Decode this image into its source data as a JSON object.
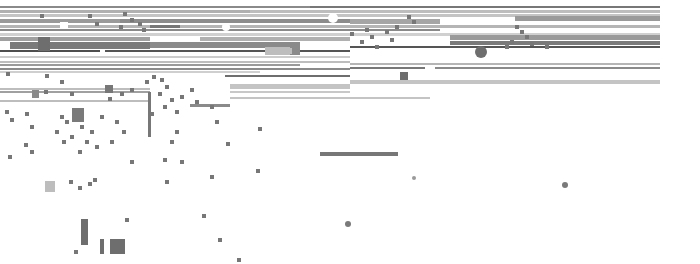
{
  "canvas": {
    "width": 700,
    "height": 264,
    "background": "#ffffff"
  },
  "palette": {
    "dark": "#555555",
    "mid": "#7a7a7a",
    "light": "#a8a8a8",
    "pale": "#c8c8c8",
    "white": "#ffffff"
  },
  "bars": [
    {
      "x": 0,
      "y": 6,
      "w": 310,
      "h": 2,
      "c": "#8a8a8a"
    },
    {
      "x": 310,
      "y": 6,
      "w": 350,
      "h": 2,
      "c": "#777777"
    },
    {
      "x": 0,
      "y": 10,
      "w": 250,
      "h": 3,
      "c": "#b0b0b0"
    },
    {
      "x": 250,
      "y": 10,
      "w": 410,
      "h": 3,
      "c": "#bdbdbd"
    },
    {
      "x": 0,
      "y": 14,
      "w": 660,
      "h": 3,
      "c": "#c4c4c4"
    },
    {
      "x": 0,
      "y": 19,
      "w": 120,
      "h": 4,
      "c": "#9a9a9a"
    },
    {
      "x": 120,
      "y": 19,
      "w": 230,
      "h": 4,
      "c": "#8c8c8c"
    },
    {
      "x": 350,
      "y": 19,
      "w": 90,
      "h": 5,
      "c": "#a5a5a5"
    },
    {
      "x": 515,
      "y": 16,
      "w": 145,
      "h": 5,
      "c": "#9a9a9a"
    },
    {
      "x": 0,
      "y": 25,
      "w": 660,
      "h": 3,
      "c": "#b5b5b5"
    },
    {
      "x": 0,
      "y": 29,
      "w": 440,
      "h": 2,
      "c": "#8a8a8a"
    },
    {
      "x": 150,
      "y": 25,
      "w": 30,
      "h": 3,
      "c": "#777777"
    },
    {
      "x": 0,
      "y": 33,
      "w": 660,
      "h": 3,
      "c": "#d0d0d0"
    },
    {
      "x": 0,
      "y": 37,
      "w": 150,
      "h": 4,
      "c": "#a0a0a0"
    },
    {
      "x": 200,
      "y": 37,
      "w": 150,
      "h": 4,
      "c": "#b0b0b0"
    },
    {
      "x": 450,
      "y": 35,
      "w": 210,
      "h": 5,
      "c": "#9a9a9a"
    },
    {
      "x": 10,
      "y": 42,
      "w": 140,
      "h": 7,
      "c": "#7a7a7a"
    },
    {
      "x": 150,
      "y": 42,
      "w": 150,
      "h": 6,
      "c": "#8a8a8a"
    },
    {
      "x": 450,
      "y": 41,
      "w": 210,
      "h": 4,
      "c": "#7a7a7a"
    },
    {
      "x": 0,
      "y": 50,
      "w": 100,
      "h": 2,
      "c": "#4e4e4e"
    },
    {
      "x": 105,
      "y": 50,
      "w": 160,
      "h": 2,
      "c": "#555555"
    },
    {
      "x": 265,
      "y": 47,
      "w": 30,
      "h": 8,
      "c": "#bdbdbd"
    },
    {
      "x": 290,
      "y": 47,
      "w": 10,
      "h": 8,
      "c": "#8a8a8a"
    },
    {
      "x": 300,
      "y": 50,
      "w": 50,
      "h": 2,
      "c": "#555555"
    },
    {
      "x": 350,
      "y": 46,
      "w": 310,
      "h": 2,
      "c": "#555555"
    },
    {
      "x": 0,
      "y": 56,
      "w": 350,
      "h": 2,
      "c": "#cccccc"
    },
    {
      "x": 0,
      "y": 61,
      "w": 350,
      "h": 2,
      "c": "#bdbdbd"
    },
    {
      "x": 0,
      "y": 64,
      "w": 300,
      "h": 2,
      "c": "#9a9a9a"
    },
    {
      "x": 350,
      "y": 63,
      "w": 310,
      "h": 2,
      "c": "#b5b5b5"
    },
    {
      "x": 0,
      "y": 68,
      "w": 350,
      "h": 2,
      "c": "#8a8a8a"
    },
    {
      "x": 350,
      "y": 67,
      "w": 75,
      "h": 2,
      "c": "#777777"
    },
    {
      "x": 435,
      "y": 67,
      "w": 225,
      "h": 2,
      "c": "#8a8a8a"
    },
    {
      "x": 0,
      "y": 71,
      "w": 260,
      "h": 2,
      "c": "#cfcfcf"
    },
    {
      "x": 225,
      "y": 75,
      "w": 125,
      "h": 2,
      "c": "#6e6e6e"
    },
    {
      "x": 350,
      "y": 80,
      "w": 310,
      "h": 4,
      "c": "#c4c4c4"
    },
    {
      "x": 0,
      "y": 88,
      "w": 150,
      "h": 2,
      "c": "#bdbdbd"
    },
    {
      "x": 230,
      "y": 84,
      "w": 120,
      "h": 5,
      "c": "#c4c4c4"
    },
    {
      "x": 0,
      "y": 91,
      "w": 150,
      "h": 2,
      "c": "#a0a0a0"
    },
    {
      "x": 230,
      "y": 91,
      "w": 120,
      "h": 2,
      "c": "#c8c8c8"
    },
    {
      "x": 0,
      "y": 100,
      "w": 150,
      "h": 2,
      "c": "#bdbdbd"
    },
    {
      "x": 230,
      "y": 97,
      "w": 200,
      "h": 2,
      "c": "#c4c4c4"
    },
    {
      "x": 190,
      "y": 104,
      "w": 40,
      "h": 3,
      "c": "#8a8a8a"
    },
    {
      "x": 320,
      "y": 152,
      "w": 78,
      "h": 4,
      "c": "#777777"
    }
  ],
  "blocks": [
    {
      "x": 38,
      "y": 37,
      "w": 12,
      "h": 14,
      "c": "#6e6e6e"
    },
    {
      "x": 60,
      "y": 22,
      "w": 8,
      "h": 6,
      "c": "#ffffff"
    },
    {
      "x": 2,
      "y": 42,
      "w": 8,
      "h": 8,
      "c": "#ffffff"
    },
    {
      "x": 270,
      "y": 48,
      "w": 22,
      "h": 6,
      "c": "#bdbdbd"
    },
    {
      "x": 400,
      "y": 72,
      "w": 8,
      "h": 8,
      "c": "#6e6e6e"
    },
    {
      "x": 105,
      "y": 85,
      "w": 8,
      "h": 8,
      "c": "#777777"
    },
    {
      "x": 32,
      "y": 90,
      "w": 7,
      "h": 8,
      "c": "#8a8a8a"
    },
    {
      "x": 72,
      "y": 108,
      "w": 12,
      "h": 14,
      "c": "#7a7a7a"
    },
    {
      "x": 45,
      "y": 181,
      "w": 10,
      "h": 11,
      "c": "#bdbdbd"
    },
    {
      "x": 81,
      "y": 219,
      "w": 7,
      "h": 26,
      "c": "#6e6e6e"
    },
    {
      "x": 100,
      "y": 239,
      "w": 4,
      "h": 15,
      "c": "#6e6e6e"
    },
    {
      "x": 110,
      "y": 239,
      "w": 15,
      "h": 15,
      "c": "#6e6e6e"
    },
    {
      "x": 148,
      "y": 92,
      "w": 3,
      "h": 45,
      "c": "#777777"
    }
  ],
  "dots": [
    {
      "x": 333,
      "y": 18,
      "r": 5,
      "c": "#ffffff"
    },
    {
      "x": 226,
      "y": 27,
      "r": 4,
      "c": "#ffffff"
    },
    {
      "x": 481,
      "y": 52,
      "r": 6,
      "c": "#6e6e6e"
    },
    {
      "x": 565,
      "y": 185,
      "r": 3,
      "c": "#7a7a7a"
    },
    {
      "x": 348,
      "y": 224,
      "r": 3,
      "c": "#7a7a7a"
    },
    {
      "x": 414,
      "y": 178,
      "r": 2,
      "c": "#9a9a9a"
    }
  ],
  "specks": [
    [
      40,
      14
    ],
    [
      88,
      14
    ],
    [
      123,
      12
    ],
    [
      130,
      18
    ],
    [
      138,
      22
    ],
    [
      119,
      25
    ],
    [
      142,
      28
    ],
    [
      95,
      22
    ],
    [
      407,
      15
    ],
    [
      412,
      20
    ],
    [
      395,
      25
    ],
    [
      385,
      30
    ],
    [
      370,
      35
    ],
    [
      360,
      40
    ],
    [
      365,
      28
    ],
    [
      350,
      32
    ],
    [
      375,
      45
    ],
    [
      390,
      38
    ],
    [
      515,
      25
    ],
    [
      520,
      30
    ],
    [
      525,
      35
    ],
    [
      510,
      40
    ],
    [
      530,
      42
    ],
    [
      505,
      45
    ],
    [
      545,
      45
    ],
    [
      6,
      72
    ],
    [
      45,
      74
    ],
    [
      60,
      80
    ],
    [
      44,
      90
    ],
    [
      70,
      92
    ],
    [
      108,
      97
    ],
    [
      120,
      92
    ],
    [
      130,
      88
    ],
    [
      145,
      80
    ],
    [
      152,
      75
    ],
    [
      160,
      78
    ],
    [
      165,
      85
    ],
    [
      158,
      92
    ],
    [
      170,
      98
    ],
    [
      163,
      105
    ],
    [
      150,
      112
    ],
    [
      175,
      110
    ],
    [
      180,
      95
    ],
    [
      190,
      88
    ],
    [
      195,
      100
    ],
    [
      210,
      105
    ],
    [
      215,
      120
    ],
    [
      175,
      130
    ],
    [
      170,
      140
    ],
    [
      5,
      110
    ],
    [
      10,
      118
    ],
    [
      25,
      112
    ],
    [
      30,
      125
    ],
    [
      60,
      115
    ],
    [
      65,
      120
    ],
    [
      55,
      130
    ],
    [
      62,
      140
    ],
    [
      70,
      135
    ],
    [
      80,
      125
    ],
    [
      90,
      130
    ],
    [
      85,
      140
    ],
    [
      78,
      150
    ],
    [
      95,
      145
    ],
    [
      100,
      115
    ],
    [
      115,
      120
    ],
    [
      122,
      130
    ],
    [
      110,
      140
    ],
    [
      24,
      143
    ],
    [
      30,
      150
    ],
    [
      8,
      155
    ],
    [
      69,
      180
    ],
    [
      78,
      186
    ],
    [
      88,
      182
    ],
    [
      93,
      178
    ],
    [
      125,
      218
    ],
    [
      74,
      250
    ],
    [
      202,
      214
    ],
    [
      210,
      175
    ],
    [
      226,
      142
    ],
    [
      258,
      127
    ],
    [
      163,
      158
    ],
    [
      180,
      160
    ],
    [
      130,
      160
    ],
    [
      218,
      238
    ],
    [
      237,
      258
    ],
    [
      256,
      169
    ],
    [
      165,
      180
    ]
  ]
}
